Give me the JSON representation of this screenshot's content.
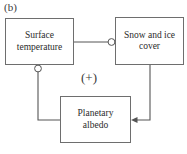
{
  "figure": {
    "panel_label": "(b)",
    "feedback_sign": "(+)",
    "line_color": "#555555",
    "box_border_color": "#6e6e6e",
    "background_color": "#ffffff",
    "text_color": "#2b2b2b"
  },
  "nodes": [
    {
      "id": "surface-temperature",
      "label": "Surface\ntemperature"
    },
    {
      "id": "snow-ice-cover",
      "label": "Snow and ice\ncover"
    },
    {
      "id": "planetary-albedo",
      "label": "Planetary\nalbedo"
    }
  ],
  "links": [
    {
      "id": "surface-temperature-to-snow-ice-cover",
      "from": "surface-temperature",
      "to": "snow-ice-cover",
      "endpoint_marker": "open-circle",
      "polarity": "negative"
    },
    {
      "id": "snow-ice-cover-to-planetary-albedo",
      "from": "snow-ice-cover",
      "to": "planetary-albedo",
      "endpoint_marker": "arrowhead",
      "polarity": "positive"
    },
    {
      "id": "planetary-albedo-to-surface-temperature",
      "from": "planetary-albedo",
      "to": "surface-temperature",
      "endpoint_marker": "open-circle",
      "polarity": "negative"
    }
  ]
}
